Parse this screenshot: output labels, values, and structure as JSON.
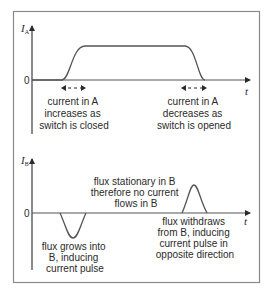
{
  "diagram": {
    "type": "current-time graphs (mutual induction)",
    "colors": {
      "frame": "#8a8a8a",
      "axis": "#2a2a2a",
      "curve": "#555555",
      "text": "#2a2a2a"
    },
    "top_graph": {
      "y_label": "I",
      "y_label_sub": "A",
      "zero_label": "0",
      "x_label": "t",
      "annotations": [
        {
          "lines": [
            "current in A",
            "increases as",
            "switch is closed"
          ]
        },
        {
          "lines": [
            "current in A",
            "decreases as",
            "switch is opened"
          ]
        }
      ]
    },
    "bottom_graph": {
      "y_label": "I",
      "y_label_sub": "B",
      "zero_label": "0",
      "x_label": "t",
      "annotations": [
        {
          "lines": [
            "flux grows into",
            "B, inducing",
            "current pulse"
          ]
        },
        {
          "lines": [
            "flux stationary in B",
            "therefore no current",
            "flows in B"
          ]
        },
        {
          "lines": [
            "flux withdraws",
            "from B, inducing",
            "current pulse in",
            "opposite direction"
          ]
        }
      ]
    }
  }
}
